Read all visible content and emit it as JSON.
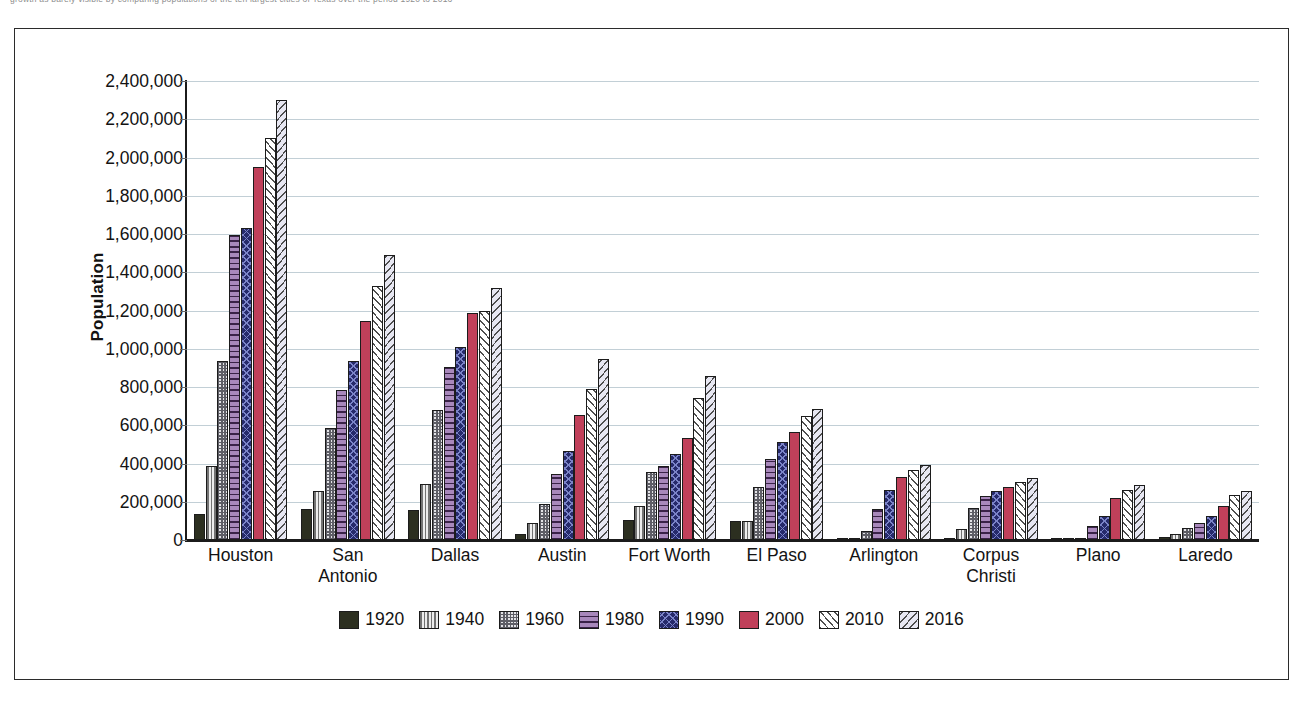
{
  "top_caption": "growth as barely visible by comparing populations of the ten largest cities of Texas over the period 1920 to 2016",
  "chart": {
    "y_axis_title": "Population",
    "y_ticks": [
      "2,400,000",
      "2,200,000",
      "2,000,000",
      "1,800,000",
      "1,600,000",
      "1,400,000",
      "1,200,000",
      "1,000,000",
      "800,000",
      "600,000",
      "400,000",
      "200,000",
      "0"
    ],
    "x_labels": [
      "Houston",
      "San\nAntonio",
      "Dallas",
      "Austin",
      "Fort Worth",
      "El Paso",
      "Arlington",
      "Corpus\nChristi",
      "Plano",
      "Laredo"
    ],
    "legend": [
      {
        "label": "1920",
        "class": "s1920",
        "color": "#2c2f20",
        "pattern": "solid-dark"
      },
      {
        "label": "1940",
        "class": "s1940",
        "color": "#f1f1f1",
        "pattern": "vertical-stripes"
      },
      {
        "label": "1960",
        "class": "s1960",
        "color": "#e3e3e6",
        "pattern": "checkerboard"
      },
      {
        "label": "1980",
        "class": "s1980",
        "color": "#9d7fb0",
        "pattern": "horizontal-stripes-purple"
      },
      {
        "label": "1990",
        "class": "s1990",
        "color": "#262a6b",
        "pattern": "diamond-grid-navy"
      },
      {
        "label": "2000",
        "class": "s2000",
        "color": "#c0405a",
        "pattern": "solid-crimson"
      },
      {
        "label": "2010",
        "class": "s2010",
        "color": "#ffffff",
        "pattern": "forward-diagonal-hatch"
      },
      {
        "label": "2016",
        "class": "s2016",
        "color": "#e3e3f0",
        "pattern": "backward-diagonal-hatch"
      }
    ]
  },
  "chart_data": {
    "type": "bar",
    "title": "",
    "xlabel": "",
    "ylabel": "Population",
    "ylim": [
      0,
      2400000
    ],
    "ytick_interval": 200000,
    "grid": true,
    "legend_position": "bottom",
    "categories": [
      "Houston",
      "San Antonio",
      "Dallas",
      "Austin",
      "Fort Worth",
      "El Paso",
      "Arlington",
      "Corpus Christi",
      "Plano",
      "Laredo"
    ],
    "series": [
      {
        "name": "1920",
        "values": [
          138000,
          161000,
          159000,
          34000,
          106000,
          101000,
          3000,
          10000,
          1700,
          14000
        ]
      },
      {
        "name": "1940",
        "values": [
          385000,
          254000,
          295000,
          88000,
          178000,
          97000,
          4000,
          57000,
          1600,
          32000
        ]
      },
      {
        "name": "1960",
        "values": [
          938000,
          588000,
          680000,
          187000,
          356000,
          277000,
          45000,
          167000,
          3700,
          61000
        ]
      },
      {
        "name": "1980",
        "values": [
          1595000,
          786000,
          904000,
          345000,
          385000,
          425000,
          160000,
          232000,
          72000,
          91000
        ]
      },
      {
        "name": "1990",
        "values": [
          1630000,
          936000,
          1007000,
          466000,
          448000,
          515000,
          261000,
          257000,
          128000,
          123000
        ]
      },
      {
        "name": "2000",
        "values": [
          1953000,
          1145000,
          1188000,
          656000,
          535000,
          564000,
          332000,
          277000,
          222000,
          176000
        ]
      },
      {
        "name": "2010",
        "values": [
          2100000,
          1327000,
          1197000,
          790000,
          741000,
          649000,
          365000,
          305000,
          259000,
          236000
        ]
      },
      {
        "name": "2016",
        "values": [
          2303000,
          1492000,
          1317000,
          947000,
          855000,
          683000,
          392000,
          325000,
          286000,
          257000
        ]
      }
    ]
  }
}
